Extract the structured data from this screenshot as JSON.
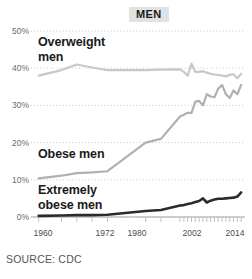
{
  "chart_data": {
    "type": "line",
    "title": "MEN",
    "xlabel": "",
    "ylabel": "",
    "source": "SOURCE: CDC",
    "xlim": [
      1960,
      2016
    ],
    "ylim": [
      0,
      50
    ],
    "grid": true,
    "legend_position": "inline-labels",
    "ytick_labels": [
      "50%",
      "40%",
      "30%",
      "20%",
      "10%",
      "0%"
    ],
    "ytick_values": [
      50,
      40,
      30,
      20,
      10,
      0
    ],
    "xtick_labels": [
      "1960",
      "1972",
      "1980",
      "2002",
      "2014"
    ],
    "xtick_values": [
      1962,
      1972,
      1980,
      2002,
      2014
    ],
    "series": [
      {
        "name": "Overweight men",
        "color": "#c8c8c8",
        "label_line1": "Overweight",
        "label_line2": "men",
        "x": [
          1962,
          1968,
          1972,
          1976,
          1980,
          1990,
          1994,
          1999,
          2000,
          2001,
          2002,
          2003,
          2004,
          2005,
          2006,
          2007,
          2008,
          2009,
          2010,
          2011,
          2012,
          2013,
          2014,
          2015
        ],
        "values": [
          38.0,
          39.5,
          41.0,
          40.2,
          39.5,
          39.5,
          39.6,
          39.7,
          39.0,
          38.0,
          41.2,
          39.0,
          39.0,
          39.2,
          38.8,
          38.5,
          38.3,
          38.2,
          38.0,
          37.8,
          38.2,
          38.4,
          37.3,
          38.5
        ]
      },
      {
        "name": "Obese men",
        "color": "#b0b0b0",
        "label_line1": "Obese men",
        "x": [
          1962,
          1968,
          1972,
          1976,
          1980,
          1990,
          1994,
          1999,
          2000,
          2001,
          2002,
          2003,
          2004,
          2005,
          2006,
          2007,
          2008,
          2009,
          2010,
          2011,
          2012,
          2013,
          2014,
          2015
        ],
        "values": [
          10.4,
          11.1,
          11.8,
          12.0,
          12.3,
          20.0,
          21.0,
          27.0,
          27.5,
          28.0,
          28.0,
          31.0,
          31.2,
          30.0,
          33.0,
          32.4,
          32.2,
          34.5,
          35.5,
          33.0,
          32.0,
          34.0,
          33.0,
          35.5
        ]
      },
      {
        "name": "Extremely obese men",
        "color": "#2b2b2b",
        "label_line1": "Extremely",
        "label_line2": "obese men",
        "x": [
          1962,
          1968,
          1972,
          1976,
          1980,
          1990,
          1994,
          1999,
          2000,
          2001,
          2002,
          2003,
          2004,
          2005,
          2006,
          2007,
          2008,
          2009,
          2010,
          2011,
          2012,
          2013,
          2014,
          2015
        ],
        "values": [
          0.3,
          0.4,
          0.5,
          0.5,
          0.6,
          1.6,
          1.9,
          3.1,
          3.2,
          3.5,
          3.7,
          4.0,
          4.3,
          5.0,
          3.9,
          4.4,
          4.7,
          4.9,
          4.9,
          5.0,
          5.1,
          5.2,
          5.5,
          6.6
        ]
      }
    ]
  }
}
